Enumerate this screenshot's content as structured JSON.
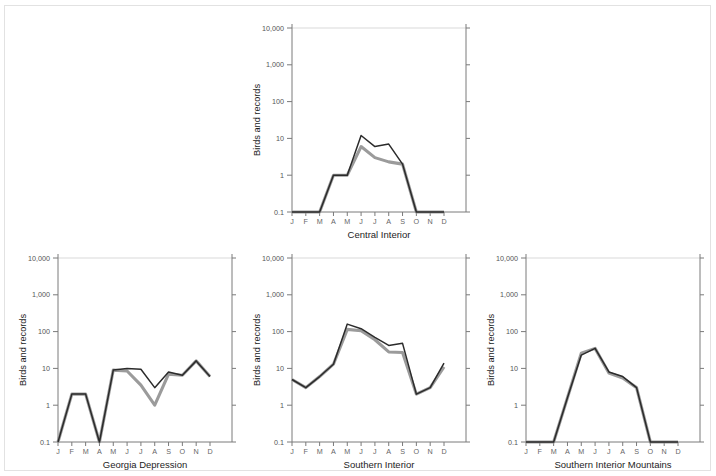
{
  "figure": {
    "y_axis_label": "Birds and records",
    "y_tick_labels": [
      "10,000",
      "1,000",
      "100",
      "10",
      "1",
      "0.1"
    ],
    "x_tick_labels": [
      "J",
      "F",
      "M",
      "A",
      "M",
      "J",
      "J",
      "A",
      "S",
      "O",
      "N",
      "D"
    ],
    "colors": {
      "records_line": "#2b2b2b",
      "birds_line": "#9b9b9b",
      "axis": "#7a7a7a",
      "gridline": "#d9d9d9",
      "background": "#ffffff",
      "border": "#e2e2e2"
    }
  },
  "chart_data": [
    {
      "type": "line",
      "title": "Central Interior",
      "xlabel": "Central Interior",
      "ylabel": "Birds and records",
      "x": [
        "J",
        "F",
        "M",
        "A",
        "M",
        "J",
        "J",
        "A",
        "S",
        "O",
        "N",
        "D"
      ],
      "ylim": [
        0.1,
        10000
      ],
      "yscale": "log",
      "yticks": [
        0.1,
        1,
        10,
        100,
        1000,
        10000
      ],
      "grid": true,
      "legend": "none",
      "series": [
        {
          "name": "records",
          "color": "#2b2b2b",
          "values": [
            0.1,
            0.1,
            0.1,
            1,
            1,
            12,
            6,
            7,
            2,
            0.1,
            0.1,
            0.1
          ]
        },
        {
          "name": "birds",
          "color": "#9b9b9b",
          "values": [
            0.1,
            0.1,
            0.1,
            1,
            1,
            6,
            3,
            2.3,
            2,
            0.1,
            0.1,
            0.1
          ]
        }
      ]
    },
    {
      "type": "line",
      "title": "Georgia Depression",
      "xlabel": "Georgia Depression",
      "ylabel": "Birds and records",
      "x": [
        "J",
        "F",
        "M",
        "A",
        "M",
        "J",
        "J",
        "A",
        "S",
        "O",
        "N",
        "D"
      ],
      "ylim": [
        0.1,
        10000
      ],
      "yscale": "log",
      "yticks": [
        0.1,
        1,
        10,
        100,
        1000,
        10000
      ],
      "grid": true,
      "legend": "none",
      "series": [
        {
          "name": "records",
          "color": "#2b2b2b",
          "values": [
            0.1,
            2,
            2,
            0.1,
            9,
            10,
            9.5,
            3,
            8,
            6.5,
            16,
            6
          ]
        },
        {
          "name": "birds",
          "color": "#9b9b9b",
          "values": [
            0.1,
            2,
            2,
            0.1,
            9,
            8.5,
            3.5,
            1,
            7,
            6.5,
            16,
            6
          ]
        }
      ]
    },
    {
      "type": "line",
      "title": "Southern Interior",
      "xlabel": "Southern Interior",
      "ylabel": "Birds and records",
      "x": [
        "J",
        "F",
        "M",
        "A",
        "M",
        "J",
        "J",
        "A",
        "S",
        "O",
        "N",
        "D"
      ],
      "ylim": [
        0.1,
        10000
      ],
      "yscale": "log",
      "yticks": [
        0.1,
        1,
        10,
        100,
        1000,
        10000
      ],
      "grid": true,
      "legend": "none",
      "series": [
        {
          "name": "records",
          "color": "#2b2b2b",
          "values": [
            5,
            3,
            6,
            13,
            160,
            120,
            70,
            42,
            48,
            2,
            3,
            14
          ]
        },
        {
          "name": "birds",
          "color": "#9b9b9b",
          "values": [
            5,
            3,
            6,
            13,
            115,
            105,
            60,
            28,
            27,
            2,
            3,
            11
          ]
        }
      ]
    },
    {
      "type": "line",
      "title": "Southern Interior Mountains",
      "xlabel": "Southern Interior Mountains",
      "ylabel": "Birds and records",
      "x": [
        "J",
        "F",
        "M",
        "A",
        "M",
        "J",
        "J",
        "A",
        "S",
        "O",
        "N",
        "D"
      ],
      "ylim": [
        0.1,
        10000
      ],
      "yscale": "log",
      "yticks": [
        0.1,
        1,
        10,
        100,
        1000,
        10000
      ],
      "grid": true,
      "legend": "none",
      "series": [
        {
          "name": "records",
          "color": "#2b2b2b",
          "values": [
            0.1,
            0.1,
            0.1,
            1.6,
            23,
            35,
            8,
            6,
            3,
            0.1,
            0.1,
            0.1
          ]
        },
        {
          "name": "birds",
          "color": "#9b9b9b",
          "values": [
            0.1,
            0.1,
            0.1,
            1.6,
            26,
            35,
            7.5,
            5.5,
            3,
            0.1,
            0.1,
            0.1
          ]
        }
      ]
    }
  ]
}
